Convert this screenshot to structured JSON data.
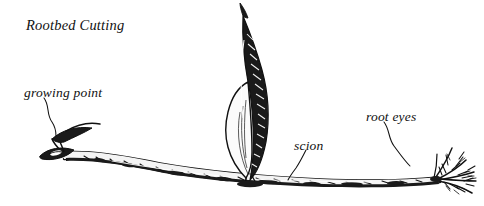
{
  "figure": {
    "title": "Rootbed Cutting",
    "background_color": "#ffffff",
    "ink_color": "#111111",
    "style": "pen-and-ink botanical line drawing",
    "width": 484,
    "height": 206
  },
  "labels": [
    {
      "id": "growing-point",
      "text": "growing point",
      "x": 24,
      "y": 85,
      "leader": "wavy line descending right to bud at left tip of root"
    },
    {
      "id": "scion",
      "text": "scion",
      "x": 294,
      "y": 138,
      "leader": "short wavy line descending left to root junction"
    },
    {
      "id": "root-eyes",
      "text": "root eyes",
      "x": 366,
      "y": 109,
      "leader": "wavy line descending right to rootlet cluster"
    }
  ],
  "drawing_parts": [
    {
      "name": "root-body",
      "description": "long tapering horizontal root running left to right, dark shading along lower edge, mottled bark texture"
    },
    {
      "name": "growing-point-bud",
      "description": "small pointed bud with two leaf-like scales at left tip of root"
    },
    {
      "name": "scion-shoot",
      "description": "tall narrow upright leafy shoot rising from middle of root, dark hatched upper blade, lighter outlined lower blade"
    },
    {
      "name": "root-eyes-rootlets",
      "description": "fine branching rootlets radiating from right end of root"
    }
  ]
}
